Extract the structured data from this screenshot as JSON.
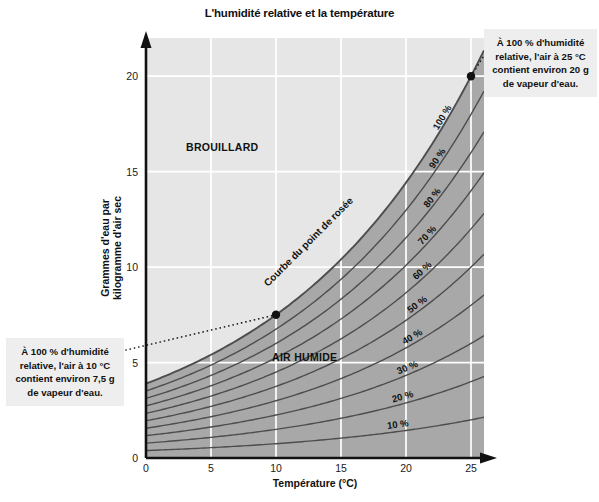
{
  "title": "L'humidité relative et la température",
  "chart_data": {
    "type": "line",
    "title": "L'humidité relative et la température",
    "xlabel": "Température (°C)",
    "ylabel": "Grammes d'eau par kilogramme d'air sec",
    "xlim": [
      0,
      26
    ],
    "ylim": [
      0,
      22
    ],
    "xticks": [
      0,
      5,
      10,
      15,
      20,
      25
    ],
    "yticks": [
      0,
      5,
      10,
      15,
      20
    ],
    "grid": true,
    "legend_position": "inline-curve-labels",
    "series": [
      {
        "name": "100 %",
        "humidity_percent": 100,
        "label": "100 %"
      },
      {
        "name": "90 %",
        "humidity_percent": 90,
        "label": "90 %"
      },
      {
        "name": "80 %",
        "humidity_percent": 80,
        "label": "80 %"
      },
      {
        "name": "70 %",
        "humidity_percent": 70,
        "label": "70 %"
      },
      {
        "name": "60 %",
        "humidity_percent": 60,
        "label": "60 %"
      },
      {
        "name": "50 %",
        "humidity_percent": 50,
        "label": "50 %"
      },
      {
        "name": "40 %",
        "humidity_percent": 40,
        "label": "40 %"
      },
      {
        "name": "30 %",
        "humidity_percent": 30,
        "label": "30 %"
      },
      {
        "name": "20 %",
        "humidity_percent": 20,
        "label": "20 %"
      },
      {
        "name": "10 %",
        "humidity_percent": 10,
        "label": "10 %"
      }
    ],
    "saturation_curve_points": [
      {
        "x": 0,
        "y": 3.8
      },
      {
        "x": 5,
        "y": 5.4
      },
      {
        "x": 10,
        "y": 7.5
      },
      {
        "x": 15,
        "y": 10.6
      },
      {
        "x": 20,
        "y": 14.6
      },
      {
        "x": 25,
        "y": 20.0
      }
    ],
    "markers": [
      {
        "x": 10,
        "y": 7.5,
        "label": "10 °C / 7,5 g"
      },
      {
        "x": 25,
        "y": 20.0,
        "label": "25 °C / 20 g"
      }
    ],
    "annotations": [
      {
        "name": "dew-point-curve-label",
        "text": "Courbe du point de rosée"
      },
      {
        "name": "fog-zone-label",
        "text": "BROUILLARD"
      },
      {
        "name": "humid-air-zone-label",
        "text": "AIR HUMIDE"
      }
    ]
  },
  "axes": {
    "x": {
      "label": "Température (°C)",
      "ticks": [
        "0",
        "5",
        "10",
        "15",
        "20",
        "25"
      ]
    },
    "y": {
      "label_line1": "Grammes d'eau par",
      "label_line2": "kilogramme d'air sec",
      "ticks": [
        "0",
        "5",
        "10",
        "15",
        "20"
      ]
    }
  },
  "zones": {
    "fog": "BROUILLARD",
    "humid_air": "AIR HUMIDE"
  },
  "dew_point_curve_label": "Courbe du point de rosée",
  "curve_labels": [
    "100 %",
    "90 %",
    "80 %",
    "70 %",
    "60 %",
    "50 %",
    "40 %",
    "30 %",
    "20 %",
    "10 %"
  ],
  "callouts": {
    "top_right": {
      "line1": "À 100 % d'humidité",
      "line2": "relative, l'air à 25 °C",
      "line3": "contient environ 20 g",
      "line4": "de vapeur d'eau."
    },
    "bottom_left": {
      "line1": "À 100 % d'humidité",
      "line2": "relative, l'air à 10 °C",
      "line3": "contient environ 7,5 g",
      "line4": "de vapeur d'eau."
    }
  },
  "colors": {
    "unsaturated_zone": "#e6e6e6",
    "saturated_zone": "#a8a8a8",
    "curve": "#4d4d4d",
    "grid": "#ffffff",
    "axis": "#111111",
    "callout_background": "#eeeeee"
  }
}
